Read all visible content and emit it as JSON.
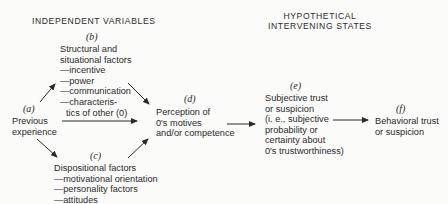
{
  "headers": {
    "independent": "INDEPENDENT VARIABLES",
    "hypothetical_line1": "HYPOTHETICAL",
    "hypothetical_line2": "INTERVENING STATES"
  },
  "nodes": {
    "a": {
      "label": "(a)",
      "lines": [
        "Previous",
        "experience"
      ]
    },
    "b": {
      "label": "(b)",
      "lines": [
        "Structural and",
        "situational factors",
        "—incentive",
        "—power",
        "—communication",
        "—characteris-",
        "tics of other (0)"
      ]
    },
    "c": {
      "label": "(c)",
      "lines": [
        "Dispositional factors",
        "—motivational orientation",
        "—personality factors",
        "—attitudes"
      ]
    },
    "d": {
      "label": "(d)",
      "lines": [
        "Perception of",
        "0's motives",
        "and/or competence"
      ]
    },
    "e": {
      "label": "(e)",
      "lines": [
        "Subjective trust",
        "or suspicion",
        "(i. e., subjective",
        "probability or",
        "certainty about",
        "0's trustworthiness)"
      ]
    },
    "f": {
      "label": "(f)",
      "lines": [
        "Behavioral trust",
        "or suspicion"
      ]
    }
  },
  "edges": [
    {
      "from": "a",
      "to": "b"
    },
    {
      "from": "a",
      "to": "d"
    },
    {
      "from": "a",
      "to": "c"
    },
    {
      "from": "b",
      "to": "d"
    },
    {
      "from": "c",
      "to": "d"
    },
    {
      "from": "d",
      "to": "e"
    },
    {
      "from": "e",
      "to": "f"
    }
  ],
  "colors": {
    "ink": "#2a2a2a",
    "background": "#fbfbf9"
  }
}
